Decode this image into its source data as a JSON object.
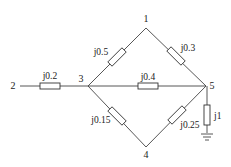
{
  "diagram": {
    "type": "power network impedance diagram",
    "colors": {
      "line": "#444444",
      "background": "#ffffff"
    },
    "nodes": [
      {
        "id": "1",
        "label": "1",
        "x": 146,
        "y": 28
      },
      {
        "id": "2",
        "label": "2",
        "x": 20,
        "y": 86
      },
      {
        "id": "3",
        "label": "3",
        "x": 88,
        "y": 86
      },
      {
        "id": "4",
        "label": "4",
        "x": 146,
        "y": 147
      },
      {
        "id": "5",
        "label": "5",
        "x": 206,
        "y": 86
      }
    ],
    "branches": [
      {
        "from": "2",
        "to": "3",
        "impedance": "j0.2"
      },
      {
        "from": "3",
        "to": "1",
        "impedance": "j0.5"
      },
      {
        "from": "1",
        "to": "5",
        "impedance": "j0.3"
      },
      {
        "from": "3",
        "to": "5",
        "impedance": "j0.4"
      },
      {
        "from": "3",
        "to": "4",
        "impedance": "j0.15"
      },
      {
        "from": "4",
        "to": "5",
        "impedance": "j0.25"
      },
      {
        "from": "5",
        "to": "ground",
        "impedance": "j1"
      }
    ],
    "labels": {
      "n1": "1",
      "n2": "2",
      "n3": "3",
      "n4": "4",
      "n5": "5",
      "z23": "j0.2",
      "z31": "j0.5",
      "z15": "j0.3",
      "z35": "j0.4",
      "z34": "j0.15",
      "z45": "j0.25",
      "z5g": "j1"
    }
  }
}
